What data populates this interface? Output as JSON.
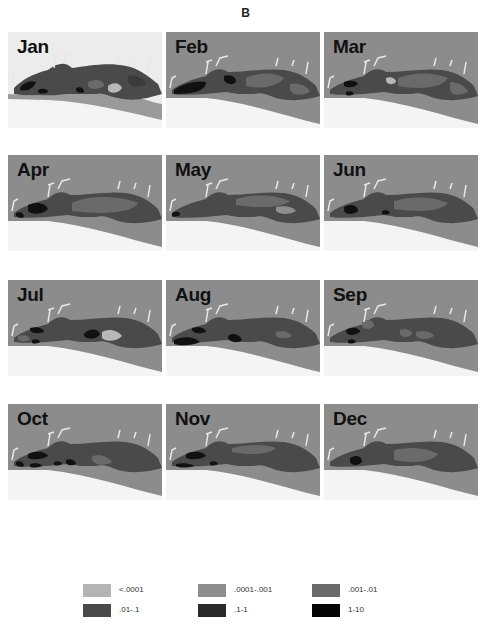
{
  "figure": {
    "label": "B",
    "background_colors": {
      "land": "#8c8c8c",
      "land_light": "#ececec",
      "gulf": "#f4f4f4"
    }
  },
  "panels": [
    {
      "month": "Jan",
      "variant": "light"
    },
    {
      "month": "Feb",
      "variant": "gray"
    },
    {
      "month": "Mar",
      "variant": "gray"
    },
    {
      "month": "Apr",
      "variant": "gray"
    },
    {
      "month": "May",
      "variant": "gray"
    },
    {
      "month": "Jun",
      "variant": "gray"
    },
    {
      "month": "Jul",
      "variant": "gray"
    },
    {
      "month": "Aug",
      "variant": "gray"
    },
    {
      "month": "Sep",
      "variant": "gray"
    },
    {
      "month": "Oct",
      "variant": "gray"
    },
    {
      "month": "Nov",
      "variant": "gray"
    },
    {
      "month": "Dec",
      "variant": "gray"
    }
  ],
  "legend": {
    "items": [
      {
        "label": "<.0001",
        "color": "#b4b4b4"
      },
      {
        "label": ".0001-.001",
        "color": "#8e8e8e"
      },
      {
        "label": ".001-.01",
        "color": "#6a6a6a"
      },
      {
        "label": ".01-.1",
        "color": "#4a4a4a"
      },
      {
        "label": ".1-1",
        "color": "#2a2a2a"
      },
      {
        "label": "1-10",
        "color": "#050505"
      }
    ]
  }
}
